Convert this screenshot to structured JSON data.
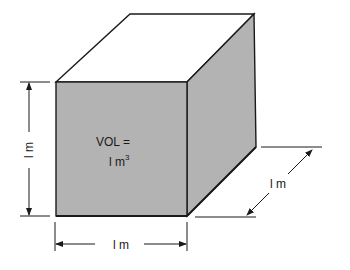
{
  "diagram": {
    "volume_label_line1": "VOL  =",
    "volume_label_line2_base": "l m",
    "volume_label_line2_exponent": "3",
    "height_dimension": "l m",
    "width_dimension": "l m",
    "depth_dimension": "l m"
  },
  "colors": {
    "face_fill": "#b3b3b3",
    "top_fill": "#ffffff",
    "stroke": "#1a1a1a"
  }
}
